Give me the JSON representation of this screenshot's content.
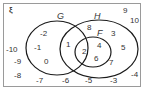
{
  "universal_symbol": "ξ",
  "sets": {
    "G": {
      "label": "G"
    },
    "H": {
      "label": "H"
    },
    "F": {
      "label": "F"
    }
  },
  "regions": {
    "G_only": [
      "-2",
      "-1",
      "0"
    ],
    "G_and_H_not_F": [
      "1"
    ],
    "G_H_F": [
      "2"
    ],
    "H_only": [
      "8",
      "3",
      "5",
      "7"
    ],
    "H_and_F_not_G": [
      "4",
      "6"
    ],
    "outside": [
      "9",
      "10",
      "-10",
      "-9",
      "-8",
      "-7",
      "-6",
      "-5",
      "-3",
      "-4"
    ]
  },
  "numbers": {
    "n_m2": "-2",
    "n_m1": "-1",
    "n_0": "0",
    "n_1": "1",
    "n_2": "2",
    "n_3": "3",
    "n_4": "4",
    "n_5": "5",
    "n_6": "6",
    "n_7": "7",
    "n_8": "8",
    "n_9": "9",
    "n_10": "10",
    "n_m10": "-10",
    "n_m9": "-9",
    "n_m8": "-8",
    "n_m7": "-7",
    "n_m6": "-6",
    "n_m5": "-5",
    "n_m3": "-3",
    "n_m4": "-4"
  },
  "colors": {
    "stroke": "#1a1a1a",
    "frame": "#9a9a9a",
    "text": "#333333"
  }
}
